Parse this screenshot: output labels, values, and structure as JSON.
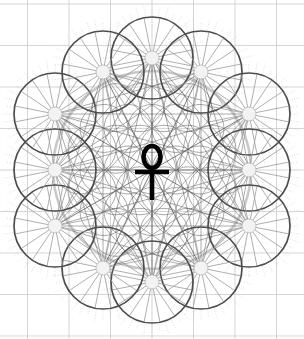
{
  "canvas": {
    "width": 304,
    "height": 339,
    "background_color": "#ffffff",
    "title": "Flower of Life Ankh Mandala"
  },
  "palette": {
    "background": "#ffffff",
    "wheel_rim": "#4d4d4d",
    "wheel_spoke": "#9a9a9a",
    "wheel_hub": "#b5b5b5",
    "fringe": "#bdbdbd",
    "flower_circle": "#8c8c8c",
    "halo_circle": "#c9c9c9",
    "grid_line": "#c4c4c4",
    "star_line": "#555555",
    "ankh": "#000000"
  },
  "center_symbol": {
    "name": "ankh",
    "label": "Ankh",
    "cx": 152,
    "cy": 170,
    "color": "#000000",
    "loop_rx": 8.5,
    "loop_ry": 11,
    "loop_cy": 157,
    "crossbar_y": 172,
    "crossbar_half_width": 17,
    "stem_bottom_y": 200,
    "stroke_width": 4.6
  },
  "flower_of_life": {
    "label": "Flower of Life",
    "cx": 152,
    "cy": 170,
    "cell_radius": 24,
    "rings": 3,
    "stroke": "#8c8c8c",
    "stroke_width": 0.75,
    "halo_radius": 99,
    "halo_stroke": "#c9c9c9",
    "halo_stroke_width": 2.6
  },
  "grid": {
    "label": "Construction grid",
    "stroke": "#c4c4c4",
    "stroke_width": 0.7,
    "spacing": 41.5,
    "lines": 9
  },
  "star_lines": {
    "label": "Connecting star lines",
    "stroke": "#555555",
    "stroke_width": 0.9,
    "count": 12
  },
  "wheels": {
    "label": "Spoked wheel circles",
    "count": 12,
    "radius": 41,
    "spokes": 16,
    "hub_radius": 7,
    "rim_stroke": "#4d4d4d",
    "rim_stroke_width": 1.7,
    "spoke_stroke": "#9a9a9a",
    "spoke_stroke_width": 0.8,
    "fringe_rays": 40,
    "fringe_stroke": "#bdbdbd",
    "positions": [
      {
        "id": "wheel-n",
        "label": "North",
        "cx": 152,
        "cy": 58
      },
      {
        "id": "wheel-nne",
        "label": "North-NE",
        "cx": 201,
        "cy": 72
      },
      {
        "id": "wheel-ene",
        "label": "East-NE",
        "cx": 249,
        "cy": 114
      },
      {
        "id": "wheel-ese",
        "label": "East-SE",
        "cx": 249,
        "cy": 170
      },
      {
        "id": "wheel-se",
        "label": "South-East",
        "cx": 249,
        "cy": 226
      },
      {
        "id": "wheel-sse",
        "label": "South-SE",
        "cx": 201,
        "cy": 268
      },
      {
        "id": "wheel-s",
        "label": "South",
        "cx": 152,
        "cy": 282
      },
      {
        "id": "wheel-ssw",
        "label": "South-SW",
        "cx": 103,
        "cy": 268
      },
      {
        "id": "wheel-sw",
        "label": "South-West",
        "cx": 55,
        "cy": 226
      },
      {
        "id": "wheel-wsw",
        "label": "West-SW",
        "cx": 55,
        "cy": 170
      },
      {
        "id": "wheel-wnw",
        "label": "West-NW",
        "cx": 55,
        "cy": 114
      },
      {
        "id": "wheel-nnw",
        "label": "North-NW",
        "cx": 103,
        "cy": 72
      }
    ]
  }
}
